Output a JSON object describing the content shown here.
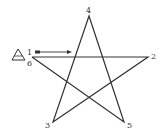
{
  "diagram": {
    "type": "pentagram-stroke-order",
    "stroke_color": "#333333",
    "background": "#ffffff",
    "vertices": [
      {
        "id": "1",
        "label": "1",
        "x": 32,
        "y": 57
      },
      {
        "id": "2",
        "label": "2",
        "x": 148,
        "y": 57
      },
      {
        "id": "3",
        "label": "3",
        "x": 53,
        "y": 122
      },
      {
        "id": "4",
        "label": "4",
        "x": 89,
        "y": 16
      },
      {
        "id": "5",
        "label": "5",
        "x": 124,
        "y": 122
      },
      {
        "id": "6",
        "label": "6",
        "x": 32,
        "y": 57
      }
    ],
    "path_order": [
      "1",
      "2",
      "3",
      "4",
      "5",
      "6"
    ],
    "start_marker": {
      "shape": "triangle",
      "meaning": "start point"
    },
    "direction_arrow": {
      "from_x": 36,
      "from_y": 52,
      "to_x": 72,
      "to_y": 52
    }
  }
}
